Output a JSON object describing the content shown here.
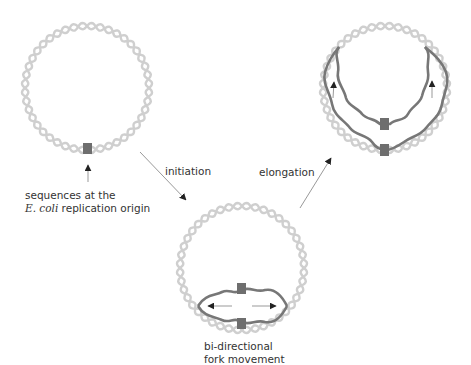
{
  "colors": {
    "parental_strand": "#cfcfcf",
    "new_strand": "#777777",
    "origin_box": "#6e6e6e",
    "arrow": "#222222",
    "line": "#999999",
    "text": "#333333"
  },
  "stages": [
    {
      "id": "origin",
      "circle_center": [
        87,
        88
      ],
      "radius": 62
    },
    {
      "id": "bubble",
      "circle_center": [
        242,
        268
      ],
      "radius": 62
    },
    {
      "id": "elongated",
      "circle_center": [
        385,
        88
      ],
      "radius": 62
    }
  ],
  "labels": {
    "origin_line1": "sequences at the",
    "origin_italic": "E. coli",
    "origin_line2_rest": " replication origin",
    "initiation": "initiation",
    "elongation": "elongation",
    "bubble_line1": "bi-directional",
    "bubble_line2": "fork movement"
  }
}
